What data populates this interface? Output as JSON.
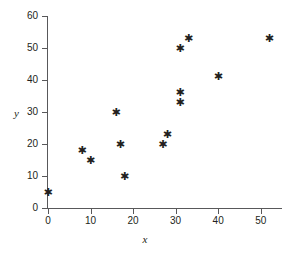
{
  "chart_data": {
    "type": "scatter",
    "title": "",
    "xlabel": "x",
    "ylabel": "y",
    "xlim": [
      0,
      55
    ],
    "ylim": [
      0,
      60
    ],
    "xticks": [
      0,
      10,
      20,
      30,
      40,
      50
    ],
    "yticks": [
      0,
      10,
      20,
      30,
      40,
      50,
      60
    ],
    "grid": false,
    "legend": null,
    "marker": "asterisk",
    "marker_color": "#231f20",
    "points": [
      {
        "x": 0,
        "y": 5
      },
      {
        "x": 8,
        "y": 18
      },
      {
        "x": 10,
        "y": 15
      },
      {
        "x": 16,
        "y": 30
      },
      {
        "x": 17,
        "y": 20
      },
      {
        "x": 18,
        "y": 10
      },
      {
        "x": 27,
        "y": 20
      },
      {
        "x": 28,
        "y": 23
      },
      {
        "x": 31,
        "y": 33
      },
      {
        "x": 31,
        "y": 36
      },
      {
        "x": 31,
        "y": 50
      },
      {
        "x": 33,
        "y": 53
      },
      {
        "x": 40,
        "y": 41
      },
      {
        "x": 52,
        "y": 53
      }
    ]
  },
  "axes": {
    "x_title": "x",
    "y_title": "y",
    "x_tick_labels": [
      "0",
      "10",
      "20",
      "30",
      "40",
      "50"
    ],
    "y_tick_labels": [
      "0",
      "10",
      "20",
      "30",
      "40",
      "50",
      "60"
    ]
  },
  "colors": {
    "axis": "#58585a",
    "text": "#231f20",
    "marker": "#231f20",
    "background": "#ffffff"
  }
}
